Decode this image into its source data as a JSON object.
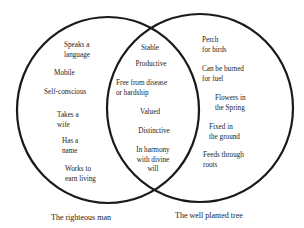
{
  "diagram": {
    "type": "venn",
    "left_set": {
      "caption": "The righteous man",
      "items": [
        "Speaks a\nlanguage",
        "Mobile",
        "Self-conscious",
        "Takes a\nwife",
        "Has a\nname",
        "Works to\nearn living"
      ]
    },
    "intersection": {
      "items": [
        "Stable",
        "Productive",
        "Free from disease\nor hardship",
        "Valued",
        "Distinctive",
        "In harmony\nwith divine\nwill"
      ]
    },
    "right_set": {
      "caption": "The well planted tree",
      "items": [
        "Perch\nfor birds",
        "Can be burned\nfor fuel",
        "Flowers in\nthe Spring",
        "Fixed in\nthe ground",
        "Feeds through\nroots"
      ]
    },
    "stroke_color": "#1a1a1a",
    "background": "#ffffff"
  }
}
